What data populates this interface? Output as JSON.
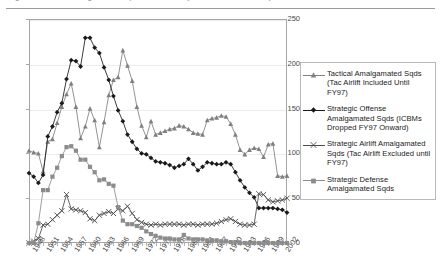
{
  "top_strip": {
    "ghost_text": "Figure — USAF amalgamated squadron totals by mission area, fiscal years 1948–2003"
  },
  "chart_data": {
    "type": "line",
    "title": "",
    "subtitle": "",
    "xlabel": "",
    "ylabel": "",
    "xlim": [
      1948,
      2003
    ],
    "ylim": [
      0,
      250
    ],
    "yticks": [
      0,
      50,
      100,
      150,
      200,
      250
    ],
    "grid": "horizontal",
    "legend_position": "right",
    "x": [
      1948,
      1949,
      1950,
      1951,
      1952,
      1953,
      1954,
      1955,
      1956,
      1957,
      1958,
      1959,
      1960,
      1961,
      1962,
      1963,
      1964,
      1965,
      1966,
      1967,
      1968,
      1969,
      1970,
      1971,
      1972,
      1973,
      1974,
      1975,
      1976,
      1977,
      1978,
      1979,
      1980,
      1981,
      1982,
      1983,
      1984,
      1985,
      1986,
      1987,
      1988,
      1989,
      1990,
      1991,
      1992,
      1993,
      1994,
      1995,
      1996,
      1997,
      1998,
      1999,
      2000,
      2001,
      2002,
      2003
    ],
    "series": [
      {
        "name": "Tactical Amalgamated Sqds (Tac Airlift Included Until FY97)",
        "marker": "triangle",
        "color": "#808080",
        "values": [
          103,
          101,
          100,
          80,
          113,
          116,
          134,
          152,
          166,
          178,
          152,
          117,
          130,
          150,
          137,
          107,
          135,
          165,
          182,
          185,
          215,
          198,
          181,
          152,
          131,
          118,
          136,
          121,
          123,
          125,
          127,
          128,
          131,
          130,
          127,
          123,
          122,
          121,
          137,
          139,
          140,
          142,
          141,
          133,
          121,
          104,
          99,
          104,
          106,
          105,
          96,
          110,
          111,
          75,
          74,
          75
        ]
      },
      {
        "name": "Strategic Offense Amalgamated Sqds (ICBMs Dropped FY97 Onward)",
        "marker": "diamond",
        "color": "#1a1a1a",
        "values": [
          78,
          74,
          67,
          76,
          119,
          130,
          146,
          156,
          183,
          204,
          203,
          197,
          229,
          229,
          218,
          212,
          196,
          182,
          164,
          148,
          136,
          121,
          113,
          105,
          100,
          99,
          95,
          91,
          90,
          89,
          87,
          84,
          86,
          88,
          94,
          88,
          81,
          85,
          90,
          89,
          88,
          88,
          90,
          88,
          79,
          70,
          62,
          56,
          51,
          39,
          39,
          39,
          39,
          38,
          37,
          34
        ]
      },
      {
        "name": "Strategic Airlift Amalgamated Sqds (Tac Airlift Excluded until FY97)",
        "marker": "cross",
        "color": "#4a4a4a",
        "values": [
          0,
          2,
          5,
          20,
          21,
          26,
          31,
          36,
          54,
          38,
          37,
          36,
          34,
          27,
          25,
          31,
          33,
          35,
          33,
          38,
          36,
          41,
          33,
          26,
          23,
          21,
          20,
          21,
          20,
          21,
          21,
          21,
          21,
          20,
          21,
          21,
          20,
          21,
          21,
          21,
          22,
          24,
          26,
          27,
          24,
          21,
          20,
          20,
          21,
          55,
          54,
          48,
          46,
          47,
          48,
          50
        ]
      },
      {
        "name": "Strategic Defense Amalgamated Sqds",
        "marker": "square",
        "color": "#8c8c8c",
        "values": [
          0,
          0,
          22,
          59,
          59,
          74,
          84,
          97,
          107,
          108,
          103,
          93,
          93,
          85,
          79,
          70,
          71,
          66,
          64,
          40,
          25,
          21,
          21,
          19,
          17,
          13,
          10,
          8,
          6,
          5,
          5,
          4,
          4,
          9,
          5,
          4,
          4,
          4,
          3,
          3,
          3,
          2,
          2,
          1,
          1,
          0,
          0,
          0,
          0,
          0,
          0,
          0,
          0,
          0,
          0,
          0
        ]
      }
    ],
    "xtick_labels": [
      "1948",
      "1951",
      "1954",
      "1957",
      "1960",
      "1963",
      "1966",
      "1969",
      "1972",
      "1975",
      "1978",
      "1981",
      "1984",
      "1987",
      "1990",
      "1993",
      "1996",
      "1999",
      "2002"
    ],
    "xtick_years": [
      1948,
      1951,
      1954,
      1957,
      1960,
      1963,
      1966,
      1969,
      1972,
      1975,
      1978,
      1981,
      1984,
      1987,
      1990,
      1993,
      1996,
      1999,
      2002
    ]
  }
}
